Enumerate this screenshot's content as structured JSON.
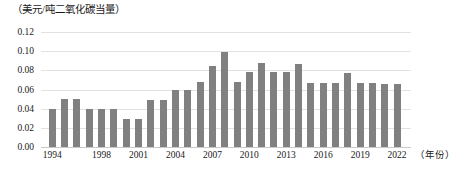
{
  "chart_data": {
    "type": "bar",
    "title": "（美元/吨二氧化碳当量）",
    "xlabel": "（年份）",
    "ylabel": "",
    "ylim": [
      0,
      0.12
    ],
    "ytick_labels": [
      "0.12",
      "0.10",
      "0.08",
      "0.06",
      "0.04",
      "0.02",
      "0.00"
    ],
    "ytick_values": [
      0.12,
      0.1,
      0.08,
      0.06,
      0.04,
      0.02,
      0.0
    ],
    "grid": true,
    "legend": "none",
    "bar_color": "#808080",
    "gridline_color": "#e2e2e2",
    "categories": [
      "1994",
      "1995",
      "1996",
      "1997",
      "1998",
      "1999",
      "2000",
      "2001",
      "2002",
      "2003",
      "2004",
      "2005",
      "2006",
      "2007",
      "2008",
      "2009",
      "2010",
      "2011",
      "2012",
      "2013",
      "2014",
      "2015",
      "2016",
      "2017",
      "2018",
      "2019",
      "2020",
      "2021",
      "2022"
    ],
    "values": [
      0.04,
      0.05,
      0.05,
      0.04,
      0.04,
      0.04,
      0.029,
      0.029,
      0.049,
      0.049,
      0.059,
      0.059,
      0.068,
      0.085,
      0.099,
      0.068,
      0.078,
      0.088,
      0.078,
      0.078,
      0.087,
      0.067,
      0.067,
      0.067,
      0.077,
      0.067,
      0.067,
      0.066,
      0.066
    ],
    "xtick_labels": [
      "1994",
      "1998",
      "2001",
      "2004",
      "2007",
      "2010",
      "2013",
      "2016",
      "2019",
      "2022"
    ],
    "xtick_categories": [
      "1994",
      "1998",
      "2001",
      "2004",
      "2007",
      "2010",
      "2013",
      "2016",
      "2019",
      "2022"
    ]
  }
}
